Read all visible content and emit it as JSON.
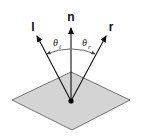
{
  "diagram": {
    "labels": {
      "incident": "l",
      "normal": "n",
      "reflected": "r",
      "theta_symbol": "θ",
      "theta_i_sub": "i",
      "theta_r_sub": "r"
    },
    "colors": {
      "surface_fill": "#d4d4d4",
      "surface_stroke": "#555555",
      "vector": "#111111",
      "arc": "#444444"
    }
  }
}
